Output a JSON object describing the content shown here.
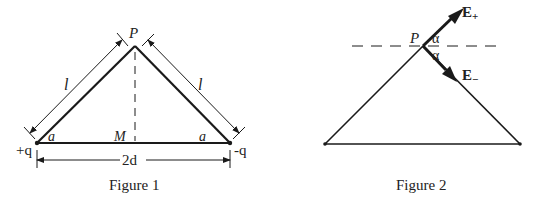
{
  "figure1": {
    "caption": "Figure 1",
    "apex_label": "P",
    "midpoint_label": "M",
    "left_charge_label": "+q",
    "right_charge_label": "-q",
    "left_angle_label": "a",
    "right_angle_label": "a",
    "left_side_label": "l",
    "right_side_label": "l",
    "base_length_label": "2d"
  },
  "figure2": {
    "caption": "Figure 2",
    "apex_label": "P",
    "upper_angle_label": "α",
    "lower_angle_label": "α",
    "e_plus_label": "E",
    "e_plus_sub": "+",
    "e_minus_label": "E",
    "e_minus_sub": "−"
  },
  "colors": {
    "line": "#1a1a1a",
    "background": "#ffffff"
  }
}
